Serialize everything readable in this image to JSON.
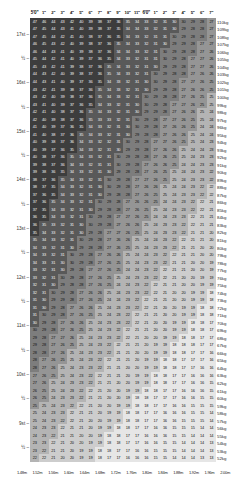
{
  "axes": {
    "top_label_name": "height-imperial",
    "bottom_label_name": "height-metric",
    "left_label_name": "weight-stones",
    "right_label_name": "weight-kilograms",
    "top_ticks": [
      "5'0\"",
      "1\"",
      "2\"",
      "3\"",
      "4\"",
      "5\"",
      "6\"",
      "7\"",
      "8\"",
      "9\"",
      "10\"",
      "11\"",
      "6'0\"",
      "1\"",
      "2\"",
      "3\"",
      "4\"",
      "5\"",
      "6\"",
      "7\""
    ],
    "bottom_ticks": [
      "1.48m",
      "1.52m",
      "1.56m",
      "1.60m",
      "1.64m",
      "1.68m",
      "1.72m",
      "1.76m",
      "1.80m",
      "1.84m",
      "1.88m",
      "1.92m",
      "1.96m",
      "2.00m"
    ],
    "left_ticks": [
      "17st",
      "½",
      "16st",
      "½",
      "15st",
      "½",
      "14st",
      "½",
      "13st",
      "½",
      "12st",
      "½",
      "11st",
      "½",
      "10st",
      "½",
      "9st",
      "½",
      "8st"
    ],
    "right_ticks": [
      "110kg",
      "109kg",
      "108kg",
      "107kg",
      "106kg",
      "105kg",
      "104kg",
      "103kg",
      "102kg",
      "101kg",
      "100kg",
      "99kg",
      "98kg",
      "97kg",
      "96kg",
      "95kg",
      "94kg",
      "93kg",
      "92kg",
      "91kg",
      "90kg",
      "89kg",
      "88kg",
      "87kg",
      "86kg",
      "85kg",
      "84kg",
      "83kg",
      "82kg",
      "81kg",
      "80kg",
      "79kg",
      "78kg",
      "77kg",
      "76kg",
      "75kg",
      "74kg",
      "73kg",
      "72kg",
      "71kg",
      "70kg",
      "69kg",
      "68kg",
      "67kg",
      "66kg",
      "65kg",
      "64kg",
      "63kg",
      "62kg",
      "61kg",
      "60kg",
      "59kg",
      "58kg",
      "57kg",
      "56kg",
      "55kg",
      "54kg",
      "53kg",
      "52kg"
    ]
  },
  "colors": {
    "obese_dark": "#4a4a4a",
    "overweight": "#8f8f8f",
    "healthy": "#c9c9c9",
    "underweight": "#e8e8e8",
    "text_dark": "#000000",
    "text_light": "#f2f2f2",
    "background": "#ffffff"
  },
  "chart_data": {
    "type": "heatmap",
    "xlabel": "Height",
    "ylabel": "Weight",
    "grid": true,
    "legend_position": "none",
    "x_columns": 20,
    "y_rows": 59,
    "x_top_labels": [
      "5'0\"",
      "1\"",
      "2\"",
      "3\"",
      "4\"",
      "5\"",
      "6\"",
      "7\"",
      "8\"",
      "9\"",
      "10\"",
      "11\"",
      "6'0\"",
      "1\"",
      "2\"",
      "3\"",
      "4\"",
      "5\"",
      "6\"",
      "7\""
    ],
    "x_bottom_labels": [
      "1.48m",
      "1.52m",
      "1.56m",
      "1.60m",
      "1.64m",
      "1.68m",
      "1.72m",
      "1.76m",
      "1.80m",
      "1.84m",
      "1.88m",
      "1.92m",
      "1.96m",
      "2.00m"
    ],
    "heights_m": [
      1.524,
      1.549,
      1.575,
      1.6,
      1.626,
      1.651,
      1.676,
      1.702,
      1.727,
      1.753,
      1.778,
      1.803,
      1.829,
      1.854,
      1.88,
      1.905,
      1.93,
      1.956,
      1.981,
      2.007
    ],
    "weights_kg": [
      110,
      109,
      108,
      107,
      106,
      105,
      104,
      103,
      102,
      101,
      100,
      99,
      98,
      97,
      96,
      95,
      94,
      93,
      92,
      91,
      90,
      89,
      88,
      87,
      86,
      85,
      84,
      83,
      82,
      81,
      80,
      79,
      78,
      77,
      76,
      75,
      74,
      73,
      72,
      71,
      70,
      69,
      68,
      67,
      66,
      65,
      64,
      63,
      62,
      61,
      60,
      59,
      58,
      57,
      56,
      55,
      54,
      53,
      52
    ],
    "y_left_labels": [
      "17st",
      "½",
      "16st",
      "½",
      "15st",
      "½",
      "14st",
      "½",
      "13st",
      "½",
      "12st",
      "½",
      "11st",
      "½",
      "10st",
      "½",
      "9st",
      "½",
      "8st"
    ],
    "y_right_labels": [
      "110kg",
      "109kg",
      "108kg",
      "107kg",
      "106kg",
      "105kg",
      "104kg",
      "103kg",
      "102kg",
      "101kg",
      "100kg",
      "99kg",
      "98kg",
      "97kg",
      "96kg",
      "95kg",
      "94kg",
      "93kg",
      "92kg",
      "91kg",
      "90kg",
      "89kg",
      "88kg",
      "87kg",
      "86kg",
      "85kg",
      "84kg",
      "83kg",
      "82kg",
      "81kg",
      "80kg",
      "79kg",
      "78kg",
      "77kg",
      "76kg",
      "75kg",
      "74kg",
      "73kg",
      "72kg",
      "71kg",
      "70kg",
      "69kg",
      "68kg",
      "67kg",
      "66kg",
      "65kg",
      "64kg",
      "63kg",
      "62kg",
      "61kg",
      "60kg",
      "59kg",
      "58kg",
      "57kg",
      "56kg",
      "55kg",
      "54kg",
      "53kg",
      "52kg"
    ],
    "cell_formula": "bmi = round(weight_kg / height_m^2)",
    "value_range": [
      13,
      48
    ],
    "bands": [
      {
        "name": "obese",
        "min": 30,
        "max": 48,
        "color": "#4a4a4a"
      },
      {
        "name": "overweight",
        "min": 25,
        "max": 30,
        "color": "#8f8f8f"
      },
      {
        "name": "healthy",
        "min": 18.5,
        "max": 25,
        "color": "#c9c9c9"
      },
      {
        "name": "underweight",
        "min": 13,
        "max": 18.5,
        "color": "#e8e8e8"
      }
    ],
    "sample_row_top": [
      48,
      48,
      46,
      45,
      44,
      43,
      42,
      42,
      41,
      40,
      39,
      38,
      37,
      36,
      36,
      35,
      34,
      33,
      32,
      32
    ],
    "sample_row_bottom": [
      23,
      22,
      21,
      20,
      20,
      19,
      19,
      18,
      18,
      17,
      17,
      16,
      16,
      15,
      15,
      15,
      14,
      14,
      13,
      13
    ]
  }
}
